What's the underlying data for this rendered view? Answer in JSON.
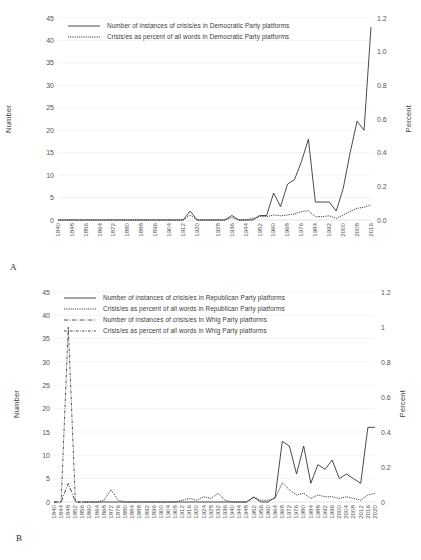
{
  "figure": {
    "panels": [
      {
        "letter": "A",
        "y_axis_label": "Number",
        "y2_axis_label": "Percent",
        "legend": [
          {
            "label": "Number of instances of crisis/es in Democratic Party platforms",
            "style": "solid"
          },
          {
            "label": "Crisis/es as percent of all words in Democratic Party platforms",
            "style": "dotted"
          }
        ]
      },
      {
        "letter": "B",
        "y_axis_label": "Number",
        "y2_axis_label": "Percent",
        "legend": [
          {
            "label": "Number of instances of crisis/es in Republican Party platforms",
            "style": "solid"
          },
          {
            "label": "Crisis/es as percent of all words in Republican Party platforms",
            "style": "dotted"
          },
          {
            "label": "Number of instances of crisis/es in Whig Party platforms",
            "style": "dashdot"
          },
          {
            "label": "Crisis/es as percent of all words in Whig Party platforms",
            "style": "dashdot2"
          }
        ]
      }
    ]
  },
  "chart_data": [
    {
      "type": "line",
      "panel": "A",
      "title": "",
      "xlabel": "",
      "ylabel": "Number",
      "y2label": "Percent",
      "ylim": [
        0,
        45
      ],
      "y2lim": [
        0,
        1.2
      ],
      "yticks": [
        "0",
        "5",
        "10",
        "15",
        "20",
        "25",
        "30",
        "35",
        "40",
        "45"
      ],
      "y2ticks": [
        "0.0",
        "0.2",
        "0.4",
        "0.6",
        "0.8",
        "1.0",
        "1.2"
      ],
      "grid": true,
      "legend_position": "top-left-inside",
      "x": [
        1840,
        1844,
        1848,
        1852,
        1856,
        1860,
        1864,
        1868,
        1872,
        1876,
        1880,
        1884,
        1888,
        1892,
        1896,
        1900,
        1904,
        1908,
        1912,
        1916,
        1920,
        1924,
        1928,
        1932,
        1936,
        1940,
        1944,
        1948,
        1952,
        1956,
        1960,
        1964,
        1968,
        1972,
        1976,
        1980,
        1984,
        1988,
        1992,
        1996,
        2000,
        2004,
        2008,
        2012,
        2016,
        2020
      ],
      "xtick_labels": [
        "1840",
        "1848",
        "1856",
        "1864",
        "1872",
        "1880",
        "1888",
        "1896",
        "1904",
        "1912",
        "1920",
        "1928",
        "1936",
        "1944",
        "1952",
        "1960",
        "1968",
        "1976",
        "1984",
        "1992",
        "2000",
        "2008",
        "2016"
      ],
      "series": [
        {
          "name": "Number of instances of crisis/es in Democratic Party platforms",
          "axis": "left",
          "style": "solid",
          "values": [
            0,
            0,
            0,
            0,
            0,
            0,
            0,
            0,
            0,
            0,
            0,
            0,
            0,
            0,
            0,
            0,
            0,
            0,
            0,
            2,
            0,
            0,
            0,
            0,
            0,
            1,
            0,
            0,
            0,
            1,
            1,
            6,
            3,
            8,
            9,
            13,
            18,
            4,
            4,
            4,
            2,
            7,
            15,
            22,
            20,
            43
          ]
        },
        {
          "name": "Crisis/es as percent of all words in Democratic Party platforms",
          "axis": "right",
          "style": "dotted",
          "values": [
            0,
            0,
            0,
            0,
            0,
            0,
            0,
            0,
            0,
            0,
            0,
            0,
            0,
            0,
            0,
            0,
            0,
            0,
            0,
            0.03,
            0,
            0,
            0,
            0,
            0,
            0.015,
            0,
            0,
            0.01,
            0.02,
            0.02,
            0.03,
            0.025,
            0.03,
            0.035,
            0.05,
            0.055,
            0.02,
            0.02,
            0.025,
            0.01,
            0.03,
            0.05,
            0.07,
            0.075,
            0.09
          ]
        }
      ]
    },
    {
      "type": "line",
      "panel": "B",
      "title": "",
      "xlabel": "",
      "ylabel": "Number",
      "y2label": "Percent",
      "ylim": [
        0,
        45
      ],
      "y2lim": [
        0,
        1.2
      ],
      "yticks": [
        "0",
        "5",
        "10",
        "15",
        "20",
        "25",
        "30",
        "35",
        "40",
        "45"
      ],
      "y2ticks": [
        "0",
        "0.2",
        "0.4",
        "0.6",
        "0.8",
        "1",
        "1.2"
      ],
      "grid": true,
      "legend_position": "top-left-inside",
      "x": [
        1840,
        1844,
        1848,
        1852,
        1856,
        1860,
        1864,
        1868,
        1872,
        1876,
        1880,
        1884,
        1888,
        1892,
        1896,
        1900,
        1904,
        1908,
        1912,
        1916,
        1920,
        1924,
        1928,
        1932,
        1936,
        1940,
        1944,
        1948,
        1952,
        1956,
        1960,
        1964,
        1968,
        1972,
        1976,
        1980,
        1984,
        1988,
        1992,
        1996,
        2000,
        2004,
        2008,
        2012,
        2016,
        2020
      ],
      "xtick_labels": [
        "1840",
        "1844",
        "1848",
        "1852",
        "1856",
        "1860",
        "1864",
        "1868",
        "1872",
        "1876",
        "1880",
        "1884",
        "1888",
        "1892",
        "1896",
        "1900",
        "1904",
        "1908",
        "1912",
        "1916",
        "1920",
        "1924",
        "1928",
        "1932",
        "1936",
        "1940",
        "1944",
        "1948",
        "1952",
        "1956",
        "1960",
        "1964",
        "1968",
        "1972",
        "1976",
        "1980",
        "1984",
        "1988",
        "1992",
        "1996",
        "2000",
        "2004",
        "2008",
        "2012",
        "2016",
        "2020"
      ],
      "series": [
        {
          "name": "Number of instances of crisis/es in Republican Party platforms",
          "axis": "left",
          "style": "solid",
          "values": [
            null,
            null,
            null,
            null,
            0,
            0,
            0,
            0,
            0,
            0,
            0,
            0,
            0,
            0,
            0,
            0,
            0,
            0,
            0,
            0,
            0,
            0,
            0,
            0,
            0,
            0,
            0,
            0,
            1,
            0,
            0,
            1,
            13,
            12,
            6,
            12,
            4,
            8,
            7,
            9,
            5,
            6,
            5,
            4,
            16,
            16
          ]
        },
        {
          "name": "Crisis/es as percent of all words in Republican Party platforms",
          "axis": "right",
          "style": "dotted",
          "values": [
            null,
            null,
            null,
            null,
            0,
            0,
            0,
            0.01,
            0.07,
            0.01,
            0,
            0,
            0,
            0,
            0,
            0,
            0,
            0,
            0.01,
            0.02,
            0.01,
            0.03,
            0.02,
            0.05,
            0.01,
            0,
            0,
            0,
            0.03,
            0.01,
            0.01,
            0.02,
            0.11,
            0.07,
            0.04,
            0.05,
            0.02,
            0.04,
            0.03,
            0.03,
            0.02,
            0.03,
            0.02,
            0.01,
            0.04,
            0.05
          ]
        },
        {
          "name": "Number of instances of crisis/es in Whig Party platforms",
          "axis": "left",
          "style": "dashdot",
          "values": [
            0,
            0,
            4,
            0,
            0,
            null,
            null,
            null,
            null,
            null,
            null,
            null,
            null,
            null,
            null,
            null,
            null,
            null,
            null,
            null,
            null,
            null,
            null,
            null,
            null,
            null,
            null,
            null,
            null,
            null,
            null,
            null,
            null,
            null,
            null,
            null,
            null,
            null,
            null,
            null,
            null,
            null,
            null,
            null,
            null,
            null
          ]
        },
        {
          "name": "Crisis/es as percent of all words in Whig Party platforms",
          "axis": "right",
          "style": "dashdot2",
          "values": [
            0,
            0,
            1.0,
            0,
            0,
            null,
            null,
            null,
            null,
            null,
            null,
            null,
            null,
            null,
            null,
            null,
            null,
            null,
            null,
            null,
            null,
            null,
            null,
            null,
            null,
            null,
            null,
            null,
            null,
            null,
            null,
            null,
            null,
            null,
            null,
            null,
            null,
            null,
            null,
            null,
            null,
            null,
            null,
            null,
            null,
            null
          ]
        }
      ]
    }
  ]
}
